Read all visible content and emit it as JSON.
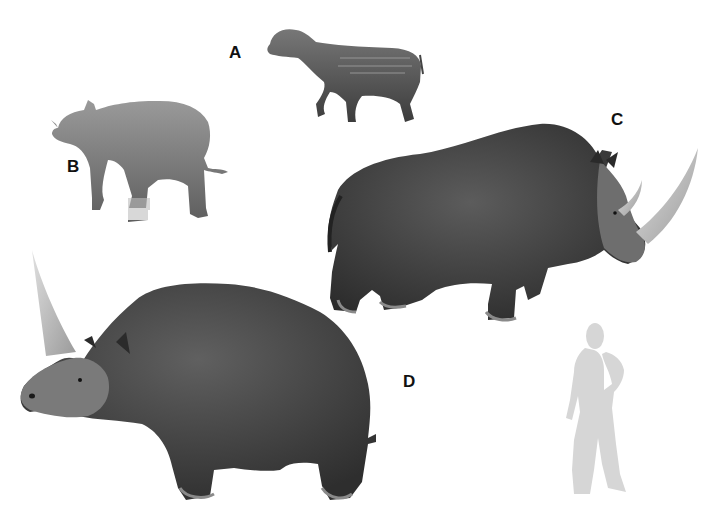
{
  "figure": {
    "labels": {
      "a": "A",
      "b": "B",
      "c": "C",
      "d": "D"
    },
    "subjects": [
      {
        "label": "A",
        "name": "small-early-rhinocerotoid",
        "color": "#5a5a5a"
      },
      {
        "label": "B",
        "name": "hornless-early-rhino",
        "color": "#7a7a7a"
      },
      {
        "label": "C",
        "name": "woolly-rhinoceros",
        "color": "#3a3a3a"
      },
      {
        "label": "D",
        "name": "elasmotherium",
        "color": "#3f3f3f"
      }
    ],
    "human_silhouette_color": "#d6d6d6",
    "horn_color": "#bdbdbd"
  }
}
